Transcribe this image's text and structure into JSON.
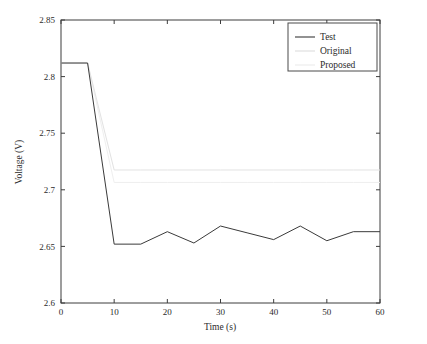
{
  "chart_data": {
    "type": "line",
    "title": "",
    "xlabel": "Time (s)",
    "ylabel": "Voltage (V)",
    "xlim": [
      0,
      60
    ],
    "ylim": [
      2.6,
      2.85
    ],
    "xticks": [
      0,
      10,
      20,
      30,
      40,
      50,
      60
    ],
    "xtick_labels": [
      "0",
      "10",
      "20",
      "30",
      "40",
      "50",
      "60"
    ],
    "yticks": [
      2.6,
      2.65,
      2.7,
      2.75,
      2.8,
      2.85
    ],
    "ytick_labels": [
      "2.6",
      "2.65",
      "2.7",
      "2.75",
      "2.8",
      "2.85"
    ],
    "grid": false,
    "legend_position": "top-right",
    "x": [
      0,
      5,
      10,
      15,
      20,
      25,
      30,
      35,
      40,
      45,
      50,
      55,
      60
    ],
    "series": [
      {
        "name": "Test",
        "color": "#3a3a3a",
        "width": 1.0,
        "values": [
          2.812,
          2.812,
          2.652,
          2.652,
          2.663,
          2.653,
          2.668,
          2.662,
          2.656,
          2.668,
          2.655,
          2.663,
          2.663
        ]
      },
      {
        "name": "Original",
        "color": "#e2e2e2",
        "width": 1.0,
        "values": [
          2.812,
          2.812,
          2.7175,
          2.7175,
          2.7175,
          2.7175,
          2.7175,
          2.7175,
          2.7175,
          2.7175,
          2.7175,
          2.7175,
          2.7175
        ]
      },
      {
        "name": "Proposed",
        "color": "#efefef",
        "width": 1.0,
        "values": [
          2.812,
          2.812,
          2.7065,
          2.7065,
          2.7065,
          2.7065,
          2.7065,
          2.7065,
          2.7065,
          2.7065,
          2.7065,
          2.7065,
          2.7065
        ]
      }
    ],
    "legend_entries": [
      {
        "label": "Test",
        "color": "#3a3a3a"
      },
      {
        "label": "Original",
        "color": "#dcdcdc"
      },
      {
        "label": "Proposed",
        "color": "#ececec"
      }
    ],
    "annotations": []
  },
  "figure": {
    "background_color": "#ffffff",
    "axis_color": "#3d3d3d",
    "text_color": "#2b2b2b"
  }
}
